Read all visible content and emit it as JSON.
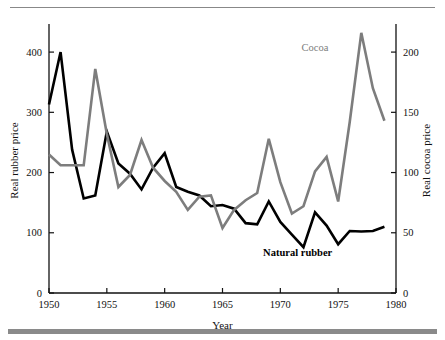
{
  "figure": {
    "background": "#ffffff",
    "top_rule_color": "#888888",
    "bottom_rule_color": "#8a8a8a"
  },
  "chart_data": {
    "type": "line",
    "title": "",
    "xlabel": "Year",
    "ylabel": "Real rubber price",
    "y2label": "Real cocoa price",
    "xlim": [
      1950,
      1980
    ],
    "ylim": [
      0,
      440
    ],
    "y2lim": [
      0,
      220
    ],
    "xticks": [
      1950,
      1955,
      1960,
      1965,
      1970,
      1975,
      1980
    ],
    "xticklabels": [
      "1950",
      "1955",
      "1960",
      "1965",
      "1970",
      "1975",
      "1980"
    ],
    "yticks": [
      0,
      100,
      200,
      300,
      400
    ],
    "yticklabels": [
      "0",
      "100",
      "200",
      "300",
      "400"
    ],
    "y2ticks": [
      0,
      50,
      100,
      150,
      200
    ],
    "y2ticklabels": [
      "0",
      "50",
      "100",
      "150",
      "200"
    ],
    "grid": false,
    "legend": "inline-annotations",
    "x": [
      1950,
      1951,
      1952,
      1953,
      1954,
      1955,
      1956,
      1957,
      1958,
      1959,
      1960,
      1961,
      1962,
      1963,
      1964,
      1965,
      1966,
      1967,
      1968,
      1969,
      1970,
      1971,
      1972,
      1973,
      1974,
      1975,
      1976,
      1977,
      1978,
      1979
    ],
    "series": [
      {
        "name": "Natural rubber",
        "axis": "left",
        "color": "#000000",
        "linewidth": 2.6,
        "label_x": 1971.5,
        "label_y": 62,
        "values": [
          313,
          400,
          238,
          157,
          162,
          268,
          215,
          198,
          172,
          208,
          232,
          176,
          168,
          162,
          144,
          146,
          140,
          116,
          114,
          152,
          118,
          97,
          76,
          134,
          112,
          81,
          103,
          102,
          103,
          110
        ]
      },
      {
        "name": "Cocoa",
        "axis": "right",
        "color": "#7d7d7d",
        "linewidth": 2.6,
        "label_x": 1973.0,
        "label_y": 201,
        "values": [
          115,
          106,
          106,
          106,
          186,
          132,
          88,
          98,
          127,
          104,
          93,
          84,
          69,
          80,
          81,
          54,
          69,
          77,
          83,
          128,
          92,
          66,
          72,
          101,
          113,
          76,
          142,
          216,
          170,
          143
        ]
      }
    ],
    "annotations": [
      {
        "text": "Cocoa",
        "series": "Cocoa"
      },
      {
        "text": "Natural rubber",
        "series": "Natural rubber"
      }
    ]
  }
}
